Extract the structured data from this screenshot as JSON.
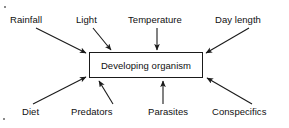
{
  "diagram": {
    "type": "influence-diagram",
    "center": {
      "label": "Developing organism",
      "box": {
        "x": 89,
        "y": 52,
        "width": 114,
        "height": 26
      },
      "border_color": "#1a1a1a",
      "fill_color": "#ffffff"
    },
    "arrow_color": "#1a1a1a",
    "factors_top": [
      {
        "name": "rainfall",
        "label": "Rainfall",
        "label_x": 10,
        "label_y": 14,
        "arrow": {
          "x1": 36,
          "y1": 28,
          "x2": 86,
          "y2": 53
        }
      },
      {
        "name": "light",
        "label": "Light",
        "label_x": 76,
        "label_y": 14,
        "arrow": {
          "x1": 93,
          "y1": 28,
          "x2": 111,
          "y2": 50
        }
      },
      {
        "name": "temperature",
        "label": "Temperature",
        "label_x": 128,
        "label_y": 14,
        "arrow": {
          "x1": 157,
          "y1": 28,
          "x2": 157,
          "y2": 50
        }
      },
      {
        "name": "day-length",
        "label": "Day length",
        "label_x": 215,
        "label_y": 14,
        "arrow": {
          "x1": 249,
          "y1": 28,
          "x2": 206,
          "y2": 53
        }
      }
    ],
    "factors_bottom": [
      {
        "name": "diet",
        "label": "Diet",
        "label_x": 22,
        "label_y": 106,
        "arrow": {
          "x1": 33,
          "y1": 104,
          "x2": 86,
          "y2": 77
        }
      },
      {
        "name": "predators",
        "label": "Predators",
        "label_x": 71,
        "label_y": 106,
        "arrow": {
          "x1": 113,
          "y1": 104,
          "x2": 99,
          "y2": 81
        }
      },
      {
        "name": "parasites",
        "label": "Parasites",
        "label_x": 148,
        "label_y": 106,
        "arrow": {
          "x1": 163,
          "y1": 104,
          "x2": 163,
          "y2": 81
        }
      },
      {
        "name": "conspecifics",
        "label": "Conspecifics",
        "label_x": 212,
        "label_y": 106,
        "arrow": {
          "x1": 252,
          "y1": 104,
          "x2": 207,
          "y2": 78
        }
      }
    ]
  }
}
